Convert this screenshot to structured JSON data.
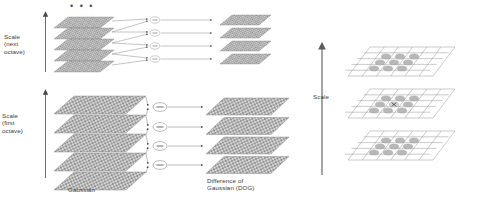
{
  "figure": {
    "background_color": "#ffffff",
    "ink_color": "#4a4a4a",
    "plane_fill_color": "#b4b4b4",
    "plane_edge_color": "#6e6e6e"
  },
  "left_panel": {
    "ellipsis": "• • •",
    "labels": {
      "scale_next_octave": "Scale\n(next\noctave)",
      "scale_first_octave": "Scale\n(first\noctave)",
      "gaussian": "Gaussian",
      "difference_of_gaussian": "Difference of\nGaussian (DOG)"
    },
    "octaves": [
      {
        "name": "next-octave",
        "gaussian_plane_count": 5,
        "dog_plane_count": 4,
        "operator_count": 4,
        "operator_symbol": "−"
      },
      {
        "name": "first-octave",
        "gaussian_plane_count": 5,
        "dog_plane_count": 4,
        "operator_count": 4,
        "operator_symbol": "−"
      }
    ],
    "scale_arrow_direction": "up"
  },
  "right_panel": {
    "labels": {
      "scale": "Scale"
    },
    "scale_arrow_direction": "up",
    "grid_plane_count": 3,
    "grid_columns": 6,
    "grid_rows": 5,
    "neighborhood_marks_per_plane": [
      9,
      9,
      9
    ],
    "center_marker": "x",
    "center_plane_index": 1
  }
}
